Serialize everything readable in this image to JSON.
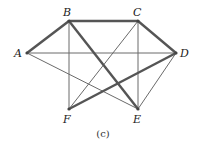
{
  "diagram": {
    "caption": "(c)",
    "nodes": [
      {
        "id": "A",
        "label": "A",
        "x": 27,
        "y": 53,
        "lx": 14,
        "ly": 57
      },
      {
        "id": "B",
        "label": "B",
        "x": 69,
        "y": 21,
        "lx": 63,
        "ly": 16
      },
      {
        "id": "C",
        "label": "C",
        "x": 138,
        "y": 21,
        "lx": 133,
        "ly": 16
      },
      {
        "id": "D",
        "label": "D",
        "x": 176,
        "y": 53,
        "lx": 180,
        "ly": 57
      },
      {
        "id": "F",
        "label": "F",
        "x": 69,
        "y": 109,
        "lx": 63,
        "ly": 123
      },
      {
        "id": "E",
        "label": "E",
        "x": 138,
        "y": 109,
        "lx": 133,
        "ly": 123
      }
    ],
    "edges": [
      {
        "from": "A",
        "to": "B",
        "weight": "thick"
      },
      {
        "from": "B",
        "to": "C",
        "weight": "thick"
      },
      {
        "from": "C",
        "to": "D",
        "weight": "thick"
      },
      {
        "from": "B",
        "to": "E",
        "weight": "thick"
      },
      {
        "from": "F",
        "to": "D",
        "weight": "thick"
      },
      {
        "from": "A",
        "to": "D",
        "weight": "thin"
      },
      {
        "from": "A",
        "to": "E",
        "weight": "thin"
      },
      {
        "from": "B",
        "to": "F",
        "weight": "thin"
      },
      {
        "from": "C",
        "to": "F",
        "weight": "thin"
      },
      {
        "from": "C",
        "to": "E",
        "weight": "thin"
      },
      {
        "from": "D",
        "to": "E",
        "weight": "thin"
      }
    ]
  }
}
